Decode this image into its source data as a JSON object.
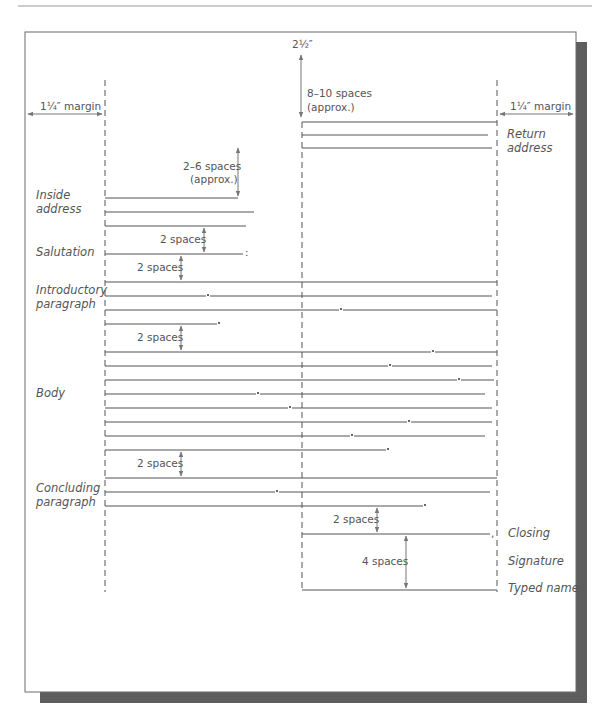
{
  "diagram": {
    "top_margin_label": "2½″",
    "left_margin_label": "1¼″ margin",
    "right_margin_label": "1¼″ margin",
    "top_spacing": [
      "8–10 spaces",
      "(approx.)"
    ],
    "inside_spacing": [
      "2–6 spaces",
      "(approx.)"
    ],
    "two_spaces": "2 spaces",
    "four_spaces": "4 spaces",
    "colon": ":",
    "comma": ",",
    "labels": {
      "return_address": [
        "Return",
        "address"
      ],
      "inside_address": [
        "Inside",
        "address"
      ],
      "salutation": "Salutation",
      "introductory": [
        "Introductory",
        "paragraph"
      ],
      "body": "Body",
      "concluding": [
        "Concluding",
        "paragraph"
      ],
      "closing": "Closing",
      "signature": "Signature",
      "typed_name": "Typed name"
    }
  },
  "lines": {
    "return_address": [
      {
        "y": 122,
        "x1": 302,
        "x2": 497
      },
      {
        "y": 135,
        "x1": 302,
        "x2": 488
      },
      {
        "y": 148,
        "x1": 302,
        "x2": 492
      }
    ],
    "inside_address": [
      {
        "y": 198,
        "x1": 105,
        "x2": 238
      },
      {
        "y": 212,
        "x1": 105,
        "x2": 254
      },
      {
        "y": 226,
        "x1": 105,
        "x2": 246
      }
    ],
    "salutation": {
      "y": 254,
      "x1": 105,
      "x2": 243
    },
    "introductory": [
      {
        "y": 282,
        "x1": 105,
        "x2": 497,
        "dot": null
      },
      {
        "y": 296,
        "x1": 105,
        "x2": 492,
        "dot": 208
      },
      {
        "y": 310,
        "x1": 105,
        "x2": 497,
        "dot": 341
      },
      {
        "y": 324,
        "x1": 105,
        "x2": 217,
        "dot": 219,
        "end": true
      }
    ],
    "body": [
      {
        "y": 352,
        "x1": 105,
        "x2": 497,
        "dot": 433
      },
      {
        "y": 366,
        "x1": 105,
        "x2": 492,
        "dot": 390
      },
      {
        "y": 380,
        "x1": 105,
        "x2": 494,
        "dot": 459
      },
      {
        "y": 394,
        "x1": 105,
        "x2": 485,
        "dot": 258
      },
      {
        "y": 408,
        "x1": 105,
        "x2": 492,
        "dot": 290
      },
      {
        "y": 422,
        "x1": 105,
        "x2": 492,
        "dot": 409
      },
      {
        "y": 436,
        "x1": 105,
        "x2": 485,
        "dot": 352
      },
      {
        "y": 450,
        "x1": 105,
        "x2": 386,
        "dot": 388,
        "end": true
      }
    ],
    "concluding": [
      {
        "y": 478,
        "x1": 105,
        "x2": 497,
        "dot": null
      },
      {
        "y": 492,
        "x1": 105,
        "x2": 490,
        "dot": 277
      },
      {
        "y": 506,
        "x1": 105,
        "x2": 423,
        "dot": 425,
        "end": true
      }
    ],
    "closing": {
      "y": 534,
      "x1": 302,
      "x2": 490
    },
    "typed_name": {
      "y": 590,
      "x1": 302,
      "x2": 497
    }
  }
}
